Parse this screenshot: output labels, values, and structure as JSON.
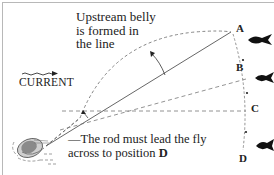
{
  "diagram": {
    "caption_top": {
      "lines": [
        "Upstream belly",
        "is formed in",
        "the line"
      ]
    },
    "current_label": "CURRENT",
    "caption_bottom": {
      "line1": "—The rod must lead the fly",
      "line2_prefix": "across to position ",
      "line2_bold": "D"
    },
    "points": {
      "a": "A",
      "b": "B",
      "c": "C",
      "d": "D"
    },
    "colors": {
      "line": "#555555",
      "dashed": "#666666",
      "fish": "#111111",
      "text": "#222222",
      "frame": "#b8b8b8"
    }
  }
}
